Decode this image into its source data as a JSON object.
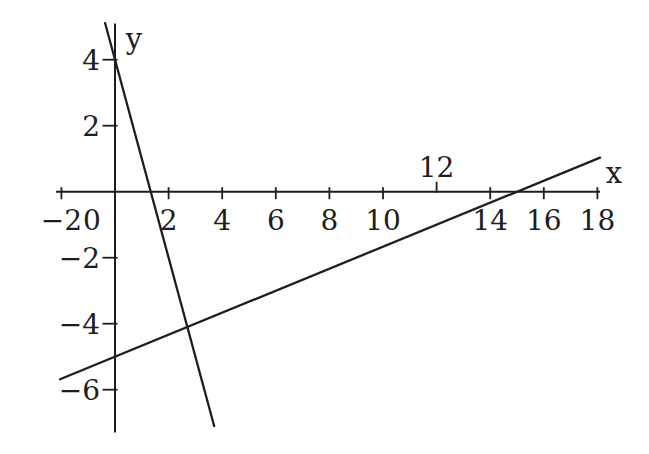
{
  "figure": {
    "background": "#ffffff",
    "ink_color": "#1e1e1e"
  },
  "chart_data": {
    "type": "line",
    "title": "",
    "xlabel": "x",
    "ylabel": "y",
    "xlim": [
      -2.2,
      18.1
    ],
    "ylim": [
      -7.3,
      5.1
    ],
    "grid": false,
    "legend": "none",
    "x_ticks": [
      -2,
      0,
      2,
      4,
      6,
      8,
      10,
      12,
      14,
      16,
      18
    ],
    "x_ticks_label_above_axis": [
      12
    ],
    "y_ticks": [
      4,
      2,
      -2,
      -4,
      -6
    ],
    "series": [
      {
        "name": "steep-line",
        "equation": "y = -3x + 4",
        "slope": -3,
        "y_intercept": 4,
        "x_intercept": 1.333,
        "x_range": [
          -0.37,
          3.7
        ],
        "points": [
          [
            -0.37,
            5.11
          ],
          [
            0,
            4
          ],
          [
            1.333,
            0
          ],
          [
            2.7,
            -4.1
          ],
          [
            3.7,
            -7.1
          ]
        ]
      },
      {
        "name": "shallow-line",
        "equation": "y = x/3 - 5",
        "slope": 0.3333,
        "y_intercept": -5,
        "x_intercept": 15,
        "x_range": [
          -2.05,
          18.1
        ],
        "points": [
          [
            -2.05,
            -5.68
          ],
          [
            0,
            -5
          ],
          [
            15,
            0
          ],
          [
            18.1,
            1.03
          ]
        ]
      }
    ],
    "intersection_point": [
      2.7,
      -4.1
    ]
  }
}
